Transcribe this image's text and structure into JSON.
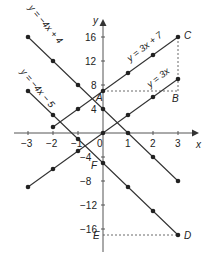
{
  "chart_data": {
    "type": "line",
    "title": "",
    "xlabel": "x",
    "ylabel": "y",
    "xlim": [
      -3,
      3
    ],
    "ylim": [
      -17,
      16
    ],
    "x_ticks": [
      -3,
      -2,
      -1,
      0,
      1,
      2,
      3
    ],
    "x_tick_labels": [
      "−3",
      "−2",
      "−1",
      "0",
      "1",
      "2",
      "3"
    ],
    "y_ticks": [
      16,
      12,
      8,
      4,
      -4,
      -8,
      -12,
      -16
    ],
    "y_tick_labels": [
      "16",
      "12",
      "8",
      "4",
      "−4",
      "−8",
      "−12",
      "−16"
    ],
    "grid": false,
    "series": [
      {
        "name": "y = −4x + 4",
        "x": [
          -3,
          -2,
          -1,
          0,
          1,
          2,
          3
        ],
        "values": [
          16,
          12,
          8,
          4,
          0,
          -4,
          -8
        ]
      },
      {
        "name": "y = −4x − 5",
        "x": [
          -3,
          -2,
          -1,
          0,
          1,
          2,
          3
        ],
        "values": [
          7,
          3,
          -1,
          -5,
          -9,
          -13,
          -17
        ]
      },
      {
        "name": "y = 3x + 7",
        "x": [
          -2,
          -1,
          0,
          1,
          2,
          3
        ],
        "values": [
          1,
          4,
          7,
          10,
          13,
          16
        ]
      },
      {
        "name": "y = 3x",
        "x": [
          -3,
          -2,
          -1,
          0,
          1,
          2,
          3
        ],
        "values": [
          -9,
          -6,
          -3,
          0,
          3,
          6,
          9
        ]
      }
    ],
    "labeled_points": [
      {
        "label": "A",
        "x": 0,
        "y": 7
      },
      {
        "label": "B",
        "x": 3,
        "y": 7
      },
      {
        "label": "C",
        "x": 3,
        "y": 16
      },
      {
        "label": "D",
        "x": 3,
        "y": -17
      },
      {
        "label": "E",
        "x": 0,
        "y": -17
      },
      {
        "label": "F",
        "x": 0,
        "y": -5
      }
    ],
    "annotations": [
      "y = −4x + 4",
      "y = −4x − 5",
      "y = 3x + 7",
      "y = 3x"
    ]
  }
}
